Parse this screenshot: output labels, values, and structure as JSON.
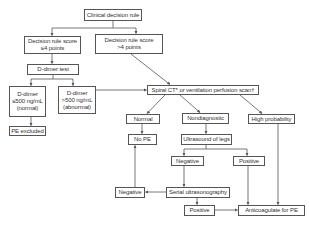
{
  "diagram": {
    "nodes": {
      "clinical_rule": "Clinical decision rule",
      "score_low_l1": "Decision rule score",
      "score_low_l2": "≤4 points",
      "score_high_l1": "Decision rule score",
      "score_high_l2": ">4 points",
      "ddimer_test": "D-dimer test",
      "ddimer_normal_l1": "D-dimer",
      "ddimer_normal_l2": "≤500 ng/mL",
      "ddimer_normal_l3": "(normal)",
      "ddimer_abnormal_l1": "D-dimer",
      "ddimer_abnormal_l2": ">500 ng/mL",
      "ddimer_abnormal_l3": "(abnormal)",
      "pe_excluded": "PE excluded",
      "spiral_ct": "Spiral CT* or ventilation perfusion scan†",
      "normal": "Normal",
      "nondiagnostic": "Nondiagnostic",
      "high_probability": "High probability",
      "no_pe": "No PE",
      "ultrasound_legs": "Ultrasound of legs",
      "negative_upper": "Negative",
      "positive_upper": "Positive",
      "negative_left": "Negative",
      "serial_ultrasonography": "Serial ultrasonography",
      "positive_lower": "Positive",
      "anticoagulate": "Anticoagulate for PE"
    },
    "edges": [
      [
        "clinical_rule",
        "score_low"
      ],
      [
        "clinical_rule",
        "score_high"
      ],
      [
        "score_low",
        "ddimer_test"
      ],
      [
        "ddimer_test",
        "ddimer_normal"
      ],
      [
        "ddimer_test",
        "ddimer_abnormal"
      ],
      [
        "ddimer_normal",
        "pe_excluded"
      ],
      [
        "ddimer_abnormal",
        "spiral_ct"
      ],
      [
        "score_high",
        "spiral_ct"
      ],
      [
        "spiral_ct",
        "normal"
      ],
      [
        "spiral_ct",
        "nondiagnostic"
      ],
      [
        "spiral_ct",
        "high_probability"
      ],
      [
        "normal",
        "no_pe"
      ],
      [
        "nondiagnostic",
        "ultrasound_legs"
      ],
      [
        "ultrasound_legs",
        "negative_upper"
      ],
      [
        "ultrasound_legs",
        "positive_upper"
      ],
      [
        "negative_upper",
        "serial_ultrasonography"
      ],
      [
        "serial_ultrasonography",
        "negative_left"
      ],
      [
        "negative_left",
        "no_pe"
      ],
      [
        "serial_ultrasonography",
        "positive_lower"
      ],
      [
        "positive_lower",
        "anticoagulate"
      ],
      [
        "positive_upper",
        "anticoagulate"
      ],
      [
        "high_probability",
        "anticoagulate"
      ]
    ],
    "colors": {
      "line": "#555555",
      "text": "#333333",
      "background": "#ffffff"
    }
  }
}
